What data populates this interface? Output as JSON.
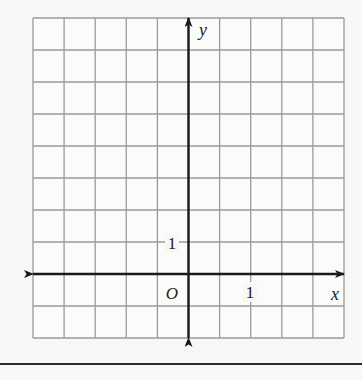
{
  "diagram": {
    "type": "coordinate-grid",
    "grid": {
      "columns": 10,
      "rows": 10,
      "left": 33,
      "top": 18,
      "right": 344,
      "bottom": 338,
      "line_color": "#9a9a9a"
    },
    "axes": {
      "color": "#1a1a1a",
      "origin_column": 5,
      "origin_row": 8,
      "x_label": "x",
      "y_label": "y",
      "origin_label": "O",
      "x_tick_label": "1",
      "y_tick_label": "1"
    },
    "bottom_rule": {
      "y": 364,
      "color": "#2a2a2a"
    }
  }
}
